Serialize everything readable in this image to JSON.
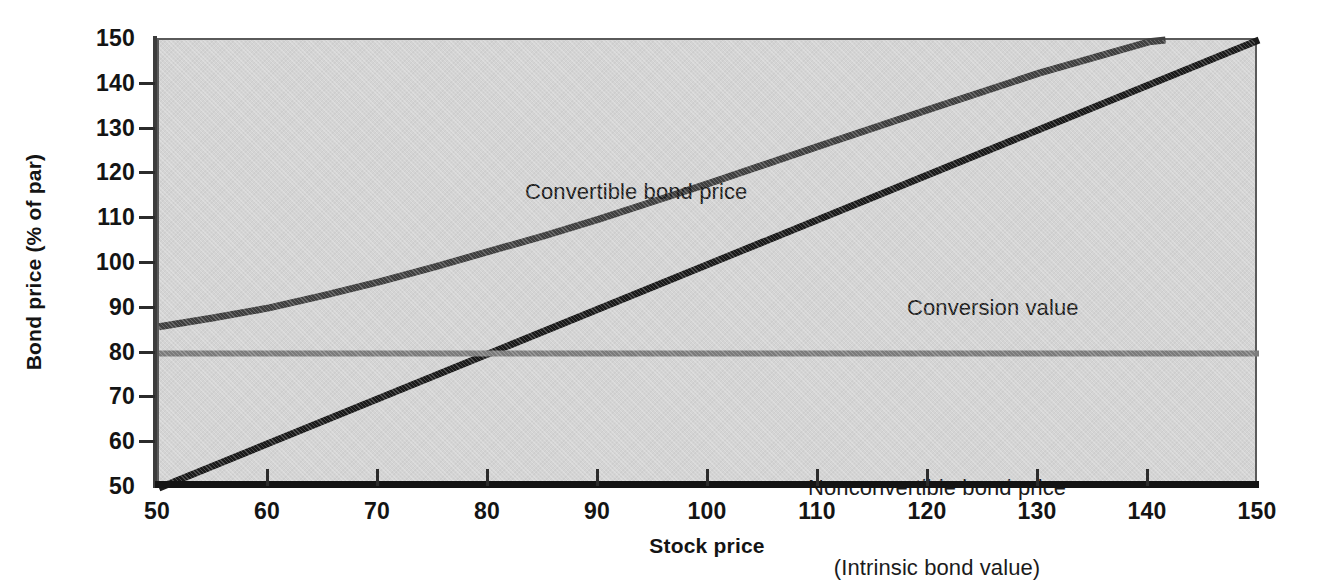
{
  "chart_data": {
    "type": "line",
    "title": "",
    "xlabel": "Stock price",
    "ylabel": "Bond price (% of par)",
    "xlim": [
      50,
      150
    ],
    "ylim": [
      50,
      150
    ],
    "xticks": [
      50,
      60,
      70,
      80,
      90,
      100,
      110,
      120,
      130,
      140,
      150
    ],
    "yticks": [
      50,
      60,
      70,
      80,
      90,
      100,
      110,
      120,
      130,
      140,
      150
    ],
    "grid": false,
    "legend_position": "inline-annotations",
    "plot_background": "#d4d4d4",
    "series": [
      {
        "name": "Convertible bond price",
        "color": "#404040",
        "linewidth": 7,
        "x": [
          50,
          55,
          60,
          65,
          70,
          75,
          80,
          85,
          90,
          95,
          100,
          110,
          120,
          130,
          140,
          141.5
        ],
        "values": [
          86,
          88,
          90.2,
          93,
          96,
          99.3,
          102.8,
          106.3,
          110,
          114,
          118,
          126.3,
          134.5,
          142.6,
          149.6,
          150
        ]
      },
      {
        "name": "Conversion value",
        "color": "#1a1a1a",
        "linewidth": 7,
        "x": [
          50,
          150
        ],
        "values": [
          50,
          150
        ]
      },
      {
        "name": "Nonconvertible bond price (Intrinsic bond value)",
        "color": "#7d7d7d",
        "linewidth": 6,
        "x": [
          50,
          150
        ],
        "values": [
          80,
          80
        ]
      }
    ],
    "annotations": [
      {
        "text": "Convertible bond price",
        "x": 73,
        "y": 122
      },
      {
        "text": "Conversion value",
        "x": 108,
        "y": 97
      },
      {
        "text": "Nonconvertible bond price",
        "x": 126,
        "y": 73.5
      },
      {
        "text": "(Intrinsic bond value)",
        "x": 126,
        "y": 70.5
      }
    ]
  },
  "axes": {
    "x_title": "Stock price",
    "y_title": "Bond price (% of par)",
    "x_tick_labels": [
      "50",
      "60",
      "70",
      "80",
      "90",
      "100",
      "110",
      "120",
      "130",
      "140",
      "150"
    ],
    "y_tick_labels": [
      "50",
      "60",
      "70",
      "80",
      "90",
      "100",
      "110",
      "120",
      "130",
      "140",
      "150"
    ]
  },
  "annotations": {
    "convertible_bond_price": "Convertible bond price",
    "conversion_value": "Conversion value",
    "nonconvertible_line1": "Nonconvertible bond price",
    "nonconvertible_line2": "(Intrinsic bond value)"
  },
  "colors": {
    "plot_background": "#d4d4d4",
    "convertible_line": "#404040",
    "conversion_line": "#1a1a1a",
    "nonconvertible_line": "#7d7d7d",
    "axis": "#141414",
    "text": "#141414"
  }
}
